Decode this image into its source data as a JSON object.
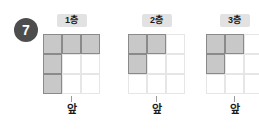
{
  "badge": {
    "number": "7"
  },
  "front_label": "앞",
  "colors": {
    "badge_bg": "#4d4d4d",
    "badge_text": "#ffffff",
    "label_pill_bg": "#e2e2e2",
    "cell_filled": "#c8c8c8",
    "cell_filled_border": "#8a8a8a",
    "cell_empty_border": "#e6e6e6"
  },
  "panels": [
    {
      "label": "1층",
      "left": 43,
      "grid": {
        "rows": 3,
        "cols": 3,
        "filled": [
          [
            1,
            1,
            1
          ],
          [
            1,
            0,
            0
          ],
          [
            1,
            0,
            0
          ]
        ]
      }
    },
    {
      "label": "2층",
      "left": 128,
      "grid": {
        "rows": 3,
        "cols": 3,
        "filled": [
          [
            1,
            1,
            0
          ],
          [
            1,
            0,
            0
          ],
          [
            0,
            0,
            0
          ]
        ]
      }
    },
    {
      "label": "3층",
      "left": 206,
      "grid": {
        "rows": 3,
        "cols": 3,
        "filled": [
          [
            1,
            1,
            0
          ],
          [
            1,
            0,
            0
          ],
          [
            0,
            0,
            0
          ]
        ]
      }
    }
  ]
}
